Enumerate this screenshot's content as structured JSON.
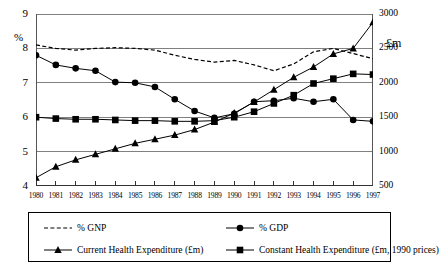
{
  "chart_data": {
    "type": "line",
    "title": "",
    "xlabel": "",
    "ylabel": "%",
    "y2label": "£m",
    "x": [
      1980,
      1981,
      1982,
      1983,
      1984,
      1985,
      1986,
      1987,
      1988,
      1989,
      1990,
      1991,
      1992,
      1993,
      1994,
      1995,
      1996,
      1997
    ],
    "categories": [
      "1980",
      "1981",
      "1982",
      "1983",
      "1984",
      "1985",
      "1986",
      "1987",
      "1988",
      "1989",
      "1990",
      "1991",
      "1992",
      "1993",
      "1994",
      "1995",
      "1996",
      "1997"
    ],
    "ylim": [
      4,
      9
    ],
    "yticks": [
      4,
      5,
      6,
      7,
      8,
      9
    ],
    "y2lim": [
      500,
      3000
    ],
    "y2ticks": [
      500,
      1000,
      1500,
      2000,
      2500,
      3000
    ],
    "grid": true,
    "legend_position": "below",
    "series": [
      {
        "name": "% GNP",
        "axis": "left",
        "marker": "none",
        "style": "dashed",
        "values": [
          8.1,
          8.0,
          7.95,
          8.0,
          8.02,
          8.0,
          7.95,
          7.8,
          7.68,
          7.6,
          7.65,
          7.52,
          7.35,
          7.55,
          7.9,
          8.0,
          7.85,
          7.7
        ]
      },
      {
        "name": "% GDP",
        "axis": "left",
        "marker": "circle",
        "style": "solid",
        "values": [
          7.8,
          7.52,
          7.42,
          7.35,
          7.02,
          7.0,
          6.88,
          6.52,
          6.18,
          5.98,
          6.1,
          6.45,
          6.48,
          6.55,
          6.45,
          6.52,
          5.92,
          5.88
        ]
      },
      {
        "name": "Current Health Expenditure (£m)",
        "axis": "right",
        "marker": "triangle",
        "style": "solid",
        "values": [
          620,
          780,
          880,
          960,
          1040,
          1120,
          1180,
          1240,
          1320,
          1430,
          1560,
          1720,
          1900,
          2080,
          2230,
          2420,
          2500,
          2880
        ]
      },
      {
        "name": "Constant Health Expenditure (£m, 1990 prices)",
        "axis": "right",
        "marker": "square",
        "style": "solid",
        "values": [
          1500,
          1480,
          1470,
          1470,
          1460,
          1450,
          1450,
          1440,
          1440,
          1450,
          1500,
          1580,
          1700,
          1820,
          1990,
          2060,
          2130,
          2120
        ]
      }
    ]
  },
  "axes": {
    "left_unit": "%",
    "right_unit": "£m",
    "left_ticks": [
      "9",
      "8",
      "7",
      "6",
      "5",
      "4"
    ],
    "right_ticks": [
      "3000",
      "2500",
      "2000",
      "1500",
      "1000",
      "500"
    ],
    "x_ticks": [
      "1980",
      "1981",
      "1982",
      "1983",
      "1984",
      "1985",
      "1986",
      "1987",
      "1988",
      "1989",
      "1990",
      "1991",
      "1992",
      "1993",
      "1994",
      "1995",
      "1996",
      "1997"
    ]
  },
  "legend": {
    "items": [
      {
        "label": "% GNP",
        "marker": "dashed-line",
        "column": 0,
        "row": 0
      },
      {
        "label": "% GDP",
        "marker": "circle-line",
        "column": 1,
        "row": 0
      },
      {
        "label": "Current Health Expenditure (£m)",
        "marker": "triangle-line",
        "column": 0,
        "row": 1
      },
      {
        "label": "Constant Health Expenditure (£m, 1990 prices)",
        "marker": "square-line",
        "column": 1,
        "row": 1
      }
    ]
  },
  "colors": {
    "line": "#000000",
    "grid": "#808080",
    "axis": "#555555",
    "background": "#ffffff"
  }
}
